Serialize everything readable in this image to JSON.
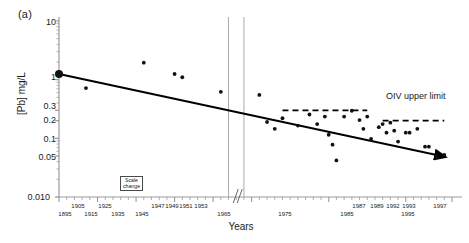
{
  "figure": {
    "panel_label": "(a)",
    "background_color": "#ffffff",
    "width": 469,
    "height": 243
  },
  "axes": {
    "y_label": "[Pb] mg/L",
    "x_label": "Years",
    "y_scale": "log",
    "y_ticks": [
      "10",
      "1",
      "0.3",
      "0.2",
      "0.1",
      "0.05",
      "0.010"
    ],
    "y_tick_values": [
      10,
      1,
      0.3,
      0.2,
      0.1,
      0.05,
      0.01
    ],
    "y_limits": [
      0.01,
      10
    ],
    "x_ticks_upper": [
      "1905",
      "1925",
      "1947",
      "1949",
      "1951",
      "1953",
      "1987",
      "1989",
      "1992",
      "1993",
      "1997"
    ],
    "x_ticks_lower": [
      "1895",
      "1915",
      "1935",
      "1945",
      "1965",
      "1975",
      "1985",
      "1995"
    ],
    "grid": false
  },
  "annotations": {
    "oiv_label": "OIV upper limit",
    "scale_change_line1": "Scale",
    "scale_change_line2": "change"
  },
  "colors": {
    "axis": "#9a9a9a",
    "data_point": "#111111",
    "trend_line": "#000000",
    "dashed_line": "#000000",
    "text": "#1a1a1a",
    "scale_marker": "#aaaaaa"
  },
  "chart_data": {
    "type": "scatter",
    "title": "",
    "xlabel": "Years",
    "ylabel": "[Pb] mg/L",
    "yscale": "log",
    "ylim": [
      0.01,
      10
    ],
    "xlim": [
      1895,
      1997
    ],
    "grid": false,
    "legend": "none",
    "series": [
      {
        "name": "Lead concentration in wine",
        "marker": "circle",
        "points": [
          {
            "x": 1895,
            "y": 1.25,
            "large": true
          },
          {
            "x": 1902,
            "y": 0.72
          },
          {
            "x": 1917,
            "y": 1.95
          },
          {
            "x": 1925,
            "y": 1.25
          },
          {
            "x": 1927,
            "y": 1.1
          },
          {
            "x": 1937,
            "y": 0.62
          },
          {
            "x": 1947,
            "y": 0.55
          },
          {
            "x": 1949,
            "y": 0.19
          },
          {
            "x": 1951,
            "y": 0.145
          },
          {
            "x": 1953,
            "y": 0.22
          },
          {
            "x": 1957,
            "y": 0.165
          },
          {
            "x": 1960,
            "y": 0.255
          },
          {
            "x": 1962,
            "y": 0.175
          },
          {
            "x": 1964,
            "y": 0.235
          },
          {
            "x": 1965,
            "y": 0.115
          },
          {
            "x": 1966,
            "y": 0.078
          },
          {
            "x": 1967,
            "y": 0.042
          },
          {
            "x": 1969,
            "y": 0.235
          },
          {
            "x": 1971,
            "y": 0.295
          },
          {
            "x": 1973,
            "y": 0.205
          },
          {
            "x": 1974,
            "y": 0.145
          },
          {
            "x": 1975,
            "y": 0.235
          },
          {
            "x": 1976,
            "y": 0.098
          },
          {
            "x": 1978,
            "y": 0.155
          },
          {
            "x": 1979,
            "y": 0.175
          },
          {
            "x": 1980,
            "y": 0.125
          },
          {
            "x": 1981,
            "y": 0.185
          },
          {
            "x": 1982,
            "y": 0.135
          },
          {
            "x": 1983,
            "y": 0.088
          },
          {
            "x": 1985,
            "y": 0.125
          },
          {
            "x": 1986,
            "y": 0.125
          },
          {
            "x": 1988,
            "y": 0.145
          },
          {
            "x": 1990,
            "y": 0.072
          },
          {
            "x": 1991,
            "y": 0.072
          },
          {
            "x": 1993,
            "y": 0.048
          },
          {
            "x": 1995,
            "y": 0.052
          }
        ]
      }
    ],
    "trend_line": {
      "name": "declining trend",
      "x_start": 1895,
      "y_start": 1.25,
      "x_end": 1997,
      "y_end": 0.048,
      "arrow_end": true
    },
    "reference_lines": [
      {
        "name": "OIV upper limit (earlier)",
        "y": 0.3,
        "x_start": 1953,
        "x_end": 1975,
        "style": "dashed"
      },
      {
        "name": "OIV upper limit (later)",
        "y": 0.2,
        "x_start": 1979,
        "x_end": 1995,
        "style": "dashed"
      }
    ],
    "scale_change_markers": {
      "x_positions": [
        1939,
        1943
      ],
      "label": "Scale change"
    }
  }
}
